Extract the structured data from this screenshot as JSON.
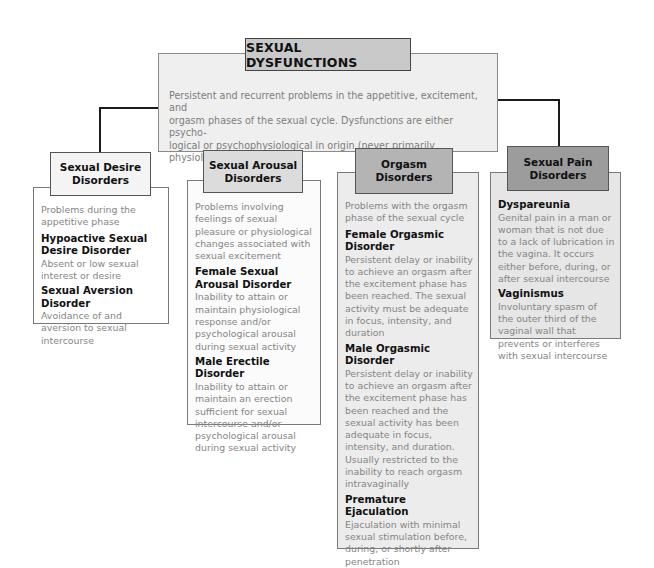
{
  "diagram": {
    "title": "SEXUAL DYSFUNCTIONS",
    "description_lines": [
      "Persistent and recurrent problems in the appetitive, excitement, and",
      "orgasm phases of the sexual cycle. Dysfunctions are either psycho-",
      "logical or psychophysiological in origin (never primarily physiological)."
    ],
    "categories": [
      {
        "header": "Sexual Desire Disorders",
        "header_lines": [
          "Sexual Desire",
          "Disorders"
        ],
        "intro": "Problems during the appetitive phase",
        "disorders": [
          {
            "name": "Hypoactive Sexual Desire Disorder",
            "definition": "Absent or low sexual interest or desire"
          },
          {
            "name": "Sexual Aversion Disorder",
            "definition": "Avoidance of and aversion to sexual intercourse"
          }
        ]
      },
      {
        "header": "Sexual Arousal Disorders",
        "header_lines": [
          "Sexual Arousal",
          "Disorders"
        ],
        "intro": "Problems involving feelings of sexual pleasure or physiological changes associated with sexual excitement",
        "disorders": [
          {
            "name": "Female Sexual Arousal Disorder",
            "definition": "Inability to attain or maintain physiological response and/or psychological arousal during sexual activity"
          },
          {
            "name": "Male Erectile Disorder",
            "definition": "Inability to attain or maintain an erection sufficient for sexual intercourse and/or psychological arousal during sexual activity"
          }
        ]
      },
      {
        "header": "Orgasm Disorders",
        "header_lines": [
          "Orgasm Disorders",
          ""
        ],
        "intro": "Problems with the orgasm phase of the sexual cycle",
        "disorders": [
          {
            "name": "Female Orgasmic Disorder",
            "definition": "Persistent delay or inability to achieve an orgasm after the excitement phase has been reached. The sexual activity must be adequate in focus, intensity, and duration"
          },
          {
            "name": "Male Orgasmic Disorder",
            "definition": "Persistent delay or inability to achieve an orgasm after the excitement phase has been reached and the sexual activity has been adequate in focus, intensity, and duration. Usually restricted to the inability to reach orgasm intravaginally"
          },
          {
            "name": "Premature Ejaculation",
            "definition": "Ejaculation with minimal sexual stimulation before, during, or shortly after penetration"
          }
        ]
      },
      {
        "header": "Sexual Pain Disorders",
        "header_lines": [
          "Sexual Pain",
          "Disorders"
        ],
        "intro": "",
        "disorders": [
          {
            "name": "Dyspareunia",
            "definition": "Genital pain in a man or woman that is not due to a lack of lubrication in the vagina. It occurs either before, during, or after sexual intercourse"
          },
          {
            "name": "Vaginismus",
            "definition": "Involuntary spasm of the outer third of the vaginal wall that prevents or interferes with sexual intercourse"
          }
        ]
      }
    ]
  },
  "colors": {
    "title_fill": "#c9c9c9",
    "description_fill": "#efefef",
    "col1_header_fill": "#f4f4f4",
    "col1_body_fill": "#ffffff",
    "col2_header_fill": "#dcdcdc",
    "col2_body_fill": "#fbfbfb",
    "col3_header_fill": "#b4b4b4",
    "col3_body_fill": "#ececec",
    "col4_header_fill": "#9c9c9c",
    "col4_body_fill": "#e6e6e6",
    "connector": "#1a1a1a"
  }
}
